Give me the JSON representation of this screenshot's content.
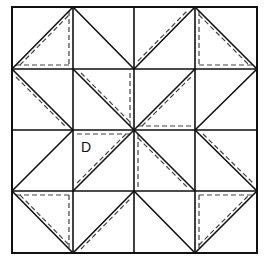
{
  "diagram": {
    "grid": {
      "rows": 4,
      "cols": 4
    },
    "grid_lines": {
      "x": [
        12,
        73,
        134,
        195,
        257
      ],
      "y": [
        7,
        69,
        130,
        191,
        253
      ]
    },
    "colors": {
      "line": "#111111",
      "dash": "#444444",
      "background": "#ffffff"
    },
    "cells": [
      {
        "row": 0,
        "col": 0,
        "diagonal": "bl-tr",
        "dashed": [
          "parallel-lower-right",
          "right",
          "bottom"
        ]
      },
      {
        "row": 0,
        "col": 1,
        "diagonal": "tl-br",
        "dashed": []
      },
      {
        "row": 0,
        "col": 2,
        "diagonal": "bl-tr",
        "dashed": [
          "parallel-upper-left"
        ]
      },
      {
        "row": 0,
        "col": 3,
        "diagonal": "tl-br",
        "dashed": [
          "parallel-lower-left",
          "left",
          "bottom"
        ]
      },
      {
        "row": 1,
        "col": 0,
        "diagonal": "tl-br",
        "dashed": [
          "parallel-lower-left"
        ]
      },
      {
        "row": 1,
        "col": 1,
        "diagonal": "tl-br",
        "dashed": [
          "parallel-upper-right",
          "right"
        ]
      },
      {
        "row": 1,
        "col": 2,
        "diagonal": "bl-tr",
        "dashed": [
          "parallel-lower-right",
          "bottom"
        ]
      },
      {
        "row": 1,
        "col": 3,
        "diagonal": "bl-tr",
        "dashed": []
      },
      {
        "row": 2,
        "col": 0,
        "diagonal": "bl-tr",
        "dashed": []
      },
      {
        "row": 2,
        "col": 1,
        "diagonal": "bl-tr",
        "dashed": [
          "top",
          "parallel-upper-left"
        ],
        "label": "D"
      },
      {
        "row": 2,
        "col": 2,
        "diagonal": "tl-br",
        "dashed": [
          "left",
          "parallel-lower-left"
        ]
      },
      {
        "row": 2,
        "col": 3,
        "diagonal": "tl-br",
        "dashed": [
          "parallel-upper-right"
        ]
      },
      {
        "row": 3,
        "col": 0,
        "diagonal": "tl-br",
        "dashed": [
          "top",
          "right",
          "parallel-upper-right"
        ]
      },
      {
        "row": 3,
        "col": 1,
        "diagonal": "bl-tr",
        "dashed": [
          "parallel-lower-right"
        ]
      },
      {
        "row": 3,
        "col": 2,
        "diagonal": "tl-br",
        "dashed": []
      },
      {
        "row": 3,
        "col": 3,
        "diagonal": "bl-tr",
        "dashed": [
          "top",
          "left",
          "parallel-upper-left"
        ]
      }
    ],
    "labels": [
      {
        "text": "D",
        "row": 2,
        "col": 1
      }
    ]
  }
}
